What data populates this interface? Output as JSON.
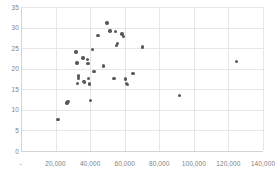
{
  "chart_data": {
    "type": "scatter",
    "title": "",
    "xlabel": "",
    "ylabel": "",
    "xlim": [
      0,
      140000
    ],
    "ylim": [
      0,
      35
    ],
    "grid": true,
    "legend": null,
    "legend_position": "none",
    "marker_color": "#595959",
    "gridline_color": "#e6e6e6",
    "axis_color": "#d4d4d4",
    "tick_label_color": "#7f7f7f",
    "xticks": [
      0,
      20000,
      40000,
      60000,
      80000,
      100000,
      120000,
      140000
    ],
    "xtick_labels": [
      "-",
      "20,000",
      "40,000",
      "60,000",
      "80,000",
      "100,000",
      "120,000",
      "140,000"
    ],
    "yticks": [
      0,
      5,
      10,
      15,
      20,
      25,
      30,
      35
    ],
    "ytick_labels": [
      "0",
      "5",
      "10",
      "15",
      "20",
      "25",
      "30",
      "35"
    ],
    "series": [
      {
        "name": "series-1",
        "points": [
          [
            21500,
            7.6
          ],
          [
            26500,
            11.7
          ],
          [
            27200,
            12.0
          ],
          [
            31800,
            24.1
          ],
          [
            32500,
            21.4
          ],
          [
            33200,
            18.2
          ],
          [
            33400,
            17.6
          ],
          [
            32800,
            16.4
          ],
          [
            35800,
            22.6
          ],
          [
            36200,
            16.9
          ],
          [
            36800,
            16.8
          ],
          [
            38500,
            22.3
          ],
          [
            38800,
            21.2
          ],
          [
            39200,
            17.6
          ],
          [
            39600,
            16.3
          ],
          [
            40200,
            12.3
          ],
          [
            41500,
            24.7
          ],
          [
            42200,
            19.3
          ],
          [
            44500,
            28.1
          ],
          [
            47800,
            20.7
          ],
          [
            49800,
            31.1
          ],
          [
            51500,
            29.2
          ],
          [
            53800,
            17.6
          ],
          [
            54500,
            29.0
          ],
          [
            55200,
            25.6
          ],
          [
            55800,
            26.1
          ],
          [
            58500,
            28.4
          ],
          [
            59200,
            27.9
          ],
          [
            60500,
            17.5
          ],
          [
            61200,
            16.4
          ],
          [
            61600,
            16.1
          ],
          [
            64800,
            18.8
          ],
          [
            70200,
            25.3
          ],
          [
            91800,
            13.5
          ],
          [
            124500,
            21.8
          ]
        ]
      }
    ]
  }
}
